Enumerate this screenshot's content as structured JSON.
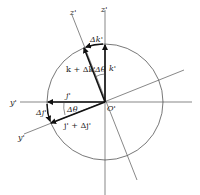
{
  "diagram": {
    "title": "",
    "origin_label": "O'",
    "axes": {
      "z_prime": "z'",
      "z_double_prime": "z'",
      "y_prime": "y'",
      "y_double_prime": "y'"
    },
    "vectors": {
      "k": "k'",
      "j": "j'",
      "k_plus_dk": "k + Δk'",
      "j_plus_dj": "j' + Δj'",
      "dk": "Δk'",
      "dj": "Δj'"
    },
    "angles": {
      "upper": "Δθ",
      "lower": "Δθ"
    },
    "colors": {
      "line": "#444444",
      "vector": "#111111",
      "background": "#ffffff"
    }
  }
}
